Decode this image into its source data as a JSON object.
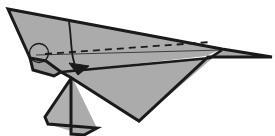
{
  "figure": {
    "canvas": {
      "width": 275,
      "height": 136
    },
    "background_color": "#ffffff"
  },
  "palette": {
    "paper_fill": "#ababab",
    "paper_fill_light": "#b6b6b6",
    "paper_fill_dark": "#9e9e9e",
    "outline": "#1a1a1a",
    "fold_line": "#3d3d3d",
    "hidden_fold_line": "#1a1a1a",
    "annotation": "#1a1a1a"
  },
  "shapes": {
    "upper_wing": {
      "name": "upper-wing-panel",
      "fill": "#ababab",
      "points": "8,9 222,49 206,56 61,72 46,61 30,58"
    },
    "lower_wing": {
      "name": "lower-wing-panel",
      "fill": "#ababab",
      "points": "61,72 210,58 222,50 139,121 70,77"
    },
    "right_tip": {
      "name": "right-wing-tip",
      "fill": "#a8a8a8",
      "points": "222,49 272,57 208,57"
    },
    "tail_fin": {
      "name": "tail-fin-panel",
      "fill": "#b0b0b0",
      "points": "72,77 45,117 48,124 84,135 71,134"
    },
    "tail_fin_right": {
      "name": "tail-fin-right-panel",
      "fill": "#ababab",
      "points": "72,77 71,134 84,135 97,128"
    },
    "nose_flap": {
      "name": "nose-flap-panel",
      "fill": "#a0a0a0",
      "points": "30,58 46,61 61,72 54,76 33,70"
    }
  },
  "outline_paths": {
    "body_outline": {
      "name": "plane-body-outline",
      "d": "M8,9 L222,49 L272,57 L208,57 L139,121 L70,77 L61,72 L46,61 L30,58 Z"
    },
    "wing_crease_main": {
      "name": "main-wing-crease",
      "d": "M61,72 L210,58 L222,50"
    },
    "tail_fin_outline": {
      "name": "tail-fin-outline",
      "d": "M72,77 L45,117 L48,124 L97,128 L84,135 L71,134 L71,77"
    },
    "nose_notch": {
      "name": "nose-notch-edge",
      "d": "M30,58 L33,70 L54,76 L61,72"
    }
  },
  "fold_lines": {
    "hidden_fold": {
      "name": "hidden-fold-dashed-line",
      "style": "dashed",
      "dash_pattern": "7,5",
      "d": "M45,54 L211,42"
    },
    "visible_fold": {
      "name": "visible-fold-thin-line",
      "style": "solid",
      "d": "M36,55 L222,50"
    }
  },
  "annotations": {
    "highlight_circle": {
      "name": "highlight-circle",
      "label": "circled fold detail",
      "cx": 39,
      "cy": 53,
      "r": 9.5,
      "stroke": "#1a1a1a",
      "fill": "none"
    },
    "fold_arrow": {
      "name": "fold-direction-arrow",
      "label": "fold downward",
      "curve_d": "M69,22 C72,40 70,58 78,73",
      "head_points": "78,75 69,63 89,66",
      "stroke": "#1a1a1a"
    }
  }
}
